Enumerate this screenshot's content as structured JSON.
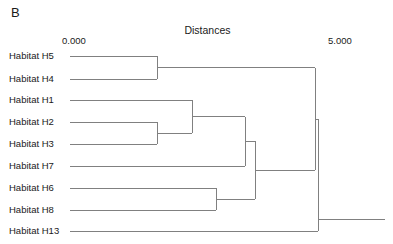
{
  "panel": {
    "label": "B"
  },
  "axis": {
    "title": "Distances",
    "min_label": "0.000",
    "max_label": "5.000",
    "min_value": 0.0,
    "max_value": 5.0
  },
  "style": {
    "line_color": "#808080",
    "text_color": "#1a1a1a",
    "background": "#ffffff",
    "line_width": 1
  },
  "chart_data": {
    "type": "dendrogram",
    "title": "Distances",
    "xlabel": "Distances",
    "ylabel": "",
    "xlim": [
      0.0,
      5.0
    ],
    "xticks": [
      0.0,
      5.0
    ],
    "xticklabels": [
      "0.000",
      "5.000"
    ],
    "grid": false,
    "legend": false,
    "orientation": "horizontal-left-to-right",
    "leaves": [
      {
        "name": "Habitat H5",
        "order": 0,
        "y": 56
      },
      {
        "name": "Habitat H4",
        "order": 1,
        "y": 79
      },
      {
        "name": "Habitat H1",
        "order": 2,
        "y": 100
      },
      {
        "name": "Habitat H2",
        "order": 3,
        "y": 122
      },
      {
        "name": "Habitat H3",
        "order": 4,
        "y": 144
      },
      {
        "name": "Habitat H7",
        "order": 5,
        "y": 166
      },
      {
        "name": "Habitat H6",
        "order": 6,
        "y": 188
      },
      {
        "name": "Habitat H8",
        "order": 7,
        "y": 210
      },
      {
        "name": "Habitat H13",
        "order": 8,
        "y": 231
      }
    ],
    "merges": [
      {
        "id": "m1",
        "left": "Habitat H5",
        "right": "Habitat H4",
        "distance": 1.64,
        "x": 157,
        "y": 67.5
      },
      {
        "id": "m2",
        "left": "Habitat H2",
        "right": "Habitat H3",
        "distance": 1.64,
        "x": 157,
        "y": 133
      },
      {
        "id": "m3",
        "left": "Habitat H1",
        "right": "m2",
        "distance": 2.31,
        "x": 192,
        "y": 116.5
      },
      {
        "id": "m4",
        "left": "Habitat H6",
        "right": "Habitat H8",
        "distance": 2.76,
        "x": 216,
        "y": 199
      },
      {
        "id": "m5",
        "left": "m3",
        "right": "Habitat H7",
        "distance": 3.3,
        "x": 245,
        "y": 141
      },
      {
        "id": "m6",
        "left": "m5",
        "right": "m4",
        "distance": 3.48,
        "x": 255,
        "y": 170
      },
      {
        "id": "m7",
        "left": "m1",
        "right": "m6",
        "distance": 4.61,
        "x": 315,
        "y": 119
      },
      {
        "id": "m8",
        "left": "m7",
        "right": "Habitat H13",
        "distance": 4.67,
        "x": 318,
        "y": 175,
        "is_root": true
      }
    ],
    "root_stem": {
      "from_x": 318,
      "to_x": 385,
      "y": 219
    },
    "leaf_start_x": 70
  }
}
